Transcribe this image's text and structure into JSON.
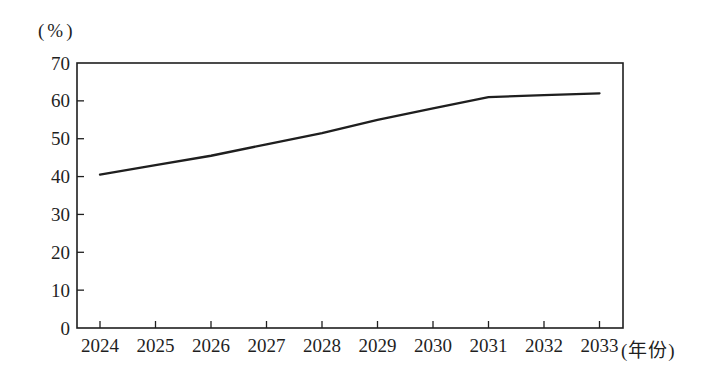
{
  "figure": {
    "background": "#ffffff",
    "ink_color": "#1f1f1f"
  },
  "chart_data": {
    "type": "line",
    "title": "",
    "ylabel": "(%)",
    "xlabel": "(年份)",
    "categories": [
      "2024",
      "2025",
      "2026",
      "2027",
      "2028",
      "2029",
      "2030",
      "2031",
      "2032",
      "2033"
    ],
    "values": [
      40.5,
      43,
      45.5,
      48.5,
      51.5,
      55,
      58,
      61,
      61.5,
      62
    ],
    "ylim": [
      0,
      70
    ],
    "yticks": [
      0,
      10,
      20,
      30,
      40,
      50,
      60,
      70
    ],
    "grid": false,
    "legend": "none",
    "line_color": "#1f1f1f",
    "plot_box": true
  }
}
